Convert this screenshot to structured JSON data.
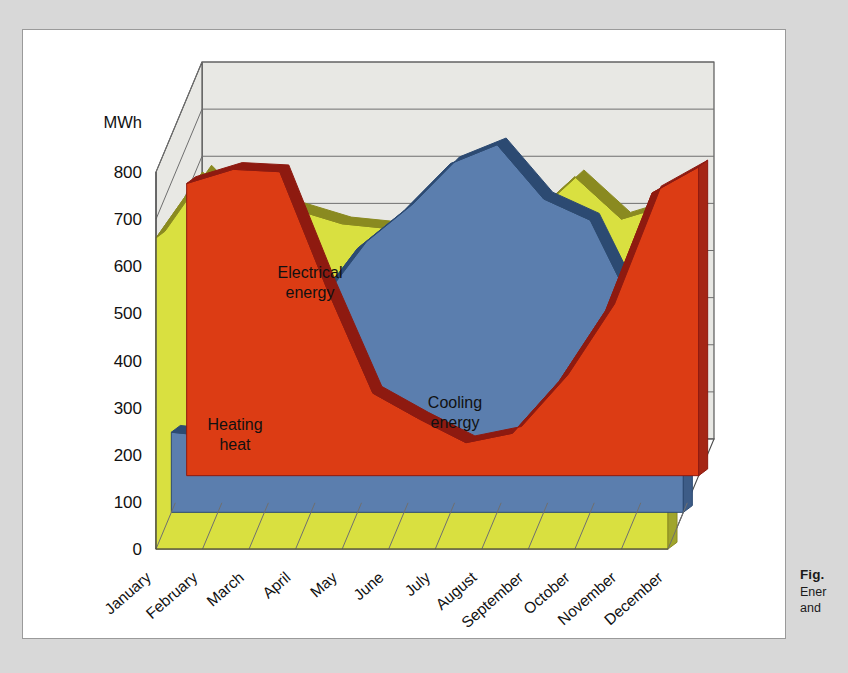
{
  "figure": {
    "caption_number": "Fig.",
    "caption_line1": "Ener",
    "caption_line2": "and"
  },
  "chart_data": {
    "type": "area",
    "title": "",
    "subtitle": "",
    "xlabel": "",
    "ylabel": "MWh",
    "unit_label": "MWh",
    "ylim": [
      0,
      800
    ],
    "ytick_values": [
      "0",
      "100",
      "200",
      "300",
      "400",
      "500",
      "600",
      "700",
      "800"
    ],
    "ytick_step": 100,
    "grid": true,
    "legend_position": "inline-labels",
    "three_d": true,
    "categories": [
      "January",
      "February",
      "March",
      "April",
      "May",
      "June",
      "July",
      "August",
      "September",
      "October",
      "November",
      "December"
    ],
    "series": [
      {
        "name": "Heating heat",
        "label": "Heating\nheat",
        "label_line1": "Heating",
        "label_line2": "heat",
        "color": "#dc3c14",
        "top_color": "#8e1a10",
        "side_color": "#a52615",
        "values": [
          620,
          650,
          645,
          400,
          175,
          120,
          70,
          90,
          200,
          350,
          600,
          655
        ]
      },
      {
        "name": "Cooling energy",
        "label": "Cooling\nenergy",
        "label_line1": "Cooling",
        "label_line2": "energy",
        "color": "#5b7eae",
        "top_color": "#2c4a72",
        "side_color": "#3d5c87",
        "values": [
          170,
          160,
          150,
          430,
          560,
          640,
          740,
          780,
          665,
          620,
          420,
          300
        ]
      },
      {
        "name": "Electrical energy",
        "label": "Electrical\nenergy",
        "label_line1": "Electrical",
        "label_line2": "energy",
        "color": "#d9e040",
        "top_color": "#8a8a20",
        "side_color": "#a0a52c",
        "values": [
          660,
          800,
          700,
          720,
          690,
          680,
          675,
          670,
          700,
          790,
          700,
          730
        ]
      }
    ]
  },
  "colors": {
    "page_background": "#d8d8d8",
    "panel_background": "#ffffff",
    "wall_background": "#e8e8e4",
    "grid_line": "#6f6f6f",
    "axis_line": "#4a4a4a"
  }
}
